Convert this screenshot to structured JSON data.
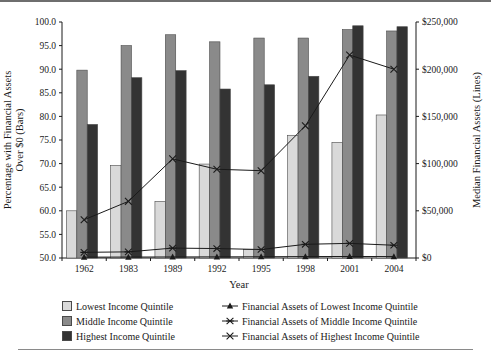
{
  "chart_data": {
    "type": "bar",
    "title": "",
    "subtitle": "",
    "xlabel": "Year",
    "ylabel": "Percentage with Financial Assets Over $0 (Bars)",
    "y2label": "Median Financial Assets (Lines)",
    "categories": [
      "1962",
      "1983",
      "1989",
      "1992",
      "1995",
      "1998",
      "2001",
      "2004"
    ],
    "ylim": [
      50.0,
      100.0
    ],
    "y2lim": [
      0,
      250000
    ],
    "yticks": [
      "50.0",
      "55.0",
      "60.0",
      "65.0",
      "70.0",
      "75.0",
      "80.0",
      "85.0",
      "90.0",
      "95.0",
      "100.0"
    ],
    "y2ticks": [
      "$0",
      "$50,000",
      "$100,000",
      "$150,000",
      "$200,000",
      "$250,000"
    ],
    "grid": false,
    "legend_position": "bottom",
    "series": [
      {
        "name": "Lowest Income Quintile",
        "kind": "bar",
        "axis": "left",
        "color": "#d9d9d9",
        "values": [
          60.0,
          69.6,
          62.0,
          69.9,
          51.8,
          76.0,
          74.5,
          80.3
        ]
      },
      {
        "name": "Middle Income Quintile",
        "kind": "bar",
        "axis": "left",
        "color": "#8a8a8a",
        "values": [
          89.8,
          95.0,
          97.3,
          95.8,
          96.6,
          96.6,
          98.4,
          98.1
        ]
      },
      {
        "name": "Highest Income Quintile",
        "kind": "bar",
        "axis": "left",
        "color": "#333333",
        "values": [
          78.3,
          88.2,
          89.7,
          85.8,
          86.7,
          88.5,
          99.2,
          99.0
        ]
      },
      {
        "name": "Financial Assets of Lowest Income Quintile",
        "kind": "line",
        "axis": "right",
        "marker": "triangle",
        "color": "#1a1a1a",
        "values": [
          900,
          1000,
          1100,
          1200,
          1300,
          1500,
          1600,
          1500
        ]
      },
      {
        "name": "Financial Assets of Middle Income Quintile",
        "kind": "line",
        "axis": "right",
        "marker": "asterisk",
        "color": "#1a1a1a",
        "values": [
          6000,
          6500,
          10500,
          10000,
          9000,
          14500,
          15500,
          13500
        ]
      },
      {
        "name": "Financial Assets of Highest Income Quintile",
        "kind": "line",
        "axis": "right",
        "marker": "x",
        "color": "#1a1a1a",
        "values": [
          40500,
          60000,
          105000,
          94000,
          92500,
          140000,
          215000,
          200000
        ]
      }
    ]
  },
  "legend": {
    "bars": [
      "Lowest Income Quintile",
      "Middle Income Quintile",
      "Highest Income Quintile"
    ],
    "lines": [
      "Financial Assets of Lowest Income Quintile",
      "Financial Assets of Middle Income Quintile",
      "Financial Assets of Highest Income Quintile"
    ]
  }
}
